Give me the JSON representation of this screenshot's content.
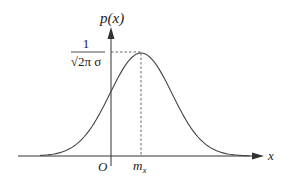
{
  "diagram": {
    "y_axis_label": "p(x)",
    "x_axis_label": "x",
    "origin_label": "O",
    "mean_label": "m",
    "mean_subscript": "x",
    "peak_value_label": {
      "numerator": "1",
      "denominator": "√2π σ"
    },
    "colors": {
      "axis": "#333333",
      "curve": "#444444",
      "dashed": "#555555"
    }
  }
}
